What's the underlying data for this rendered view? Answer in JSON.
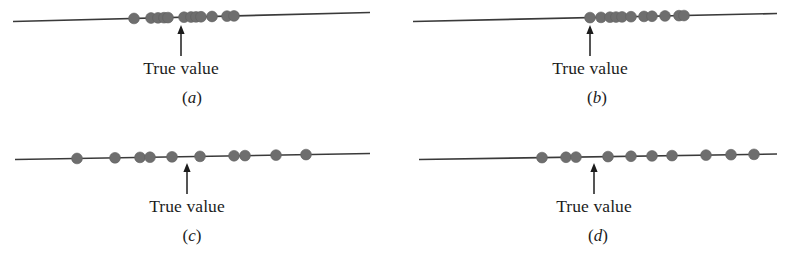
{
  "figure": {
    "colors": {
      "dot": "#6e6e6e",
      "dot_edge": "#5f5f5f",
      "line": "#3a3a3a",
      "arrow": "#1c1c1c",
      "text": "#1c1c1c",
      "background": "#ffffff"
    },
    "geometry": {
      "dot_radius": 5.4,
      "line_width": 1.6,
      "arrow_width": 1.5
    }
  },
  "panels": [
    {
      "id": "a",
      "caption_prefix": "(",
      "caption_letter": "a",
      "caption_suffix": ")",
      "arrow_label": "True value",
      "line": {
        "x1": 13,
        "y1": 21.5,
        "x2": 370,
        "y2": 12.5
      },
      "true_value_x": 181,
      "arrow": {
        "x": 181,
        "y_top": 26,
        "y_bottom": 56
      },
      "label_pos": {
        "x": 181,
        "y": 58
      },
      "caption_pos": {
        "x": 192,
        "y": 88
      },
      "dots_x": [
        134,
        151,
        158,
        164,
        168,
        184,
        191,
        196,
        201,
        212,
        227,
        234
      ],
      "dot_count": 12,
      "description": "high precision, high accuracy"
    },
    {
      "id": "b",
      "caption_prefix": "(",
      "caption_letter": "b",
      "caption_suffix": ")",
      "arrow_label": "True value",
      "line": {
        "x1": 19,
        "y1": 21.5,
        "x2": 383,
        "y2": 13.5
      },
      "true_value_x": 196,
      "arrow": {
        "x": 196,
        "y_top": 26,
        "y_bottom": 56
      },
      "label_pos": {
        "x": 196,
        "y": 58
      },
      "caption_pos": {
        "x": 203,
        "y": 88
      },
      "dots_x": [
        196,
        207,
        216,
        222,
        228,
        237,
        250,
        258,
        271,
        285,
        290
      ],
      "dot_count": 11,
      "description": "high precision, low accuracy"
    },
    {
      "id": "c",
      "caption_prefix": "(",
      "caption_letter": "c",
      "caption_suffix": ")",
      "arrow_label": "True value",
      "line": {
        "x1": 15,
        "y1": 22.5,
        "x2": 370,
        "y2": 16.5
      },
      "true_value_x": 187,
      "arrow": {
        "x": 187,
        "y_top": 27,
        "y_bottom": 57
      },
      "label_pos": {
        "x": 187,
        "y": 59
      },
      "caption_pos": {
        "x": 192,
        "y": 89
      },
      "dots_x": [
        77,
        115,
        140,
        150,
        172,
        200,
        234,
        245,
        276,
        306
      ],
      "dot_count": 10,
      "description": "low precision, high accuracy"
    },
    {
      "id": "d",
      "caption_prefix": "(",
      "caption_letter": "d",
      "caption_suffix": ")",
      "arrow_label": "True value",
      "line": {
        "x1": 25,
        "y1": 22.5,
        "x2": 383,
        "y2": 17.0
      },
      "true_value_x": 200,
      "arrow": {
        "x": 200,
        "y_top": 27,
        "y_bottom": 57
      },
      "label_pos": {
        "x": 200,
        "y": 59
      },
      "caption_pos": {
        "x": 204,
        "y": 89
      },
      "dots_x": [
        148,
        172,
        182,
        214,
        237,
        258,
        278,
        312,
        337,
        360
      ],
      "dot_count": 10,
      "description": "low precision, low accuracy"
    }
  ]
}
